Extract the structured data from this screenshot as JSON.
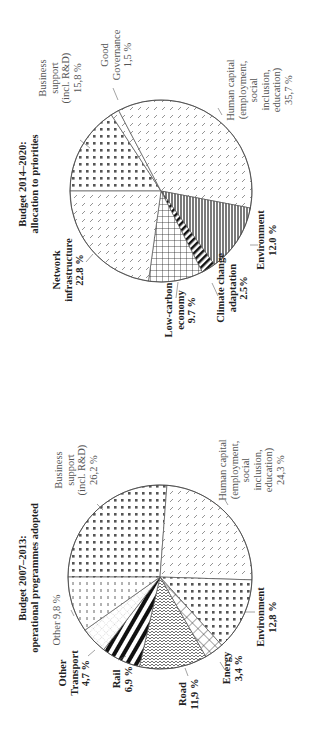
{
  "chart_data": [
    {
      "type": "pie",
      "title": "Budget 2014–2020: allocation to priorities",
      "title_lines": [
        "Budget 2014–2020:",
        "allocation to priorities"
      ],
      "start_angle_note": "slices clockwise from 12 o'clock (figure rotated 90° CCW)",
      "categories": [
        "Business support (incl. R&D)",
        "Good Governance",
        "Human capital (employment, social inclusion, education)",
        "Environment",
        "Climate change adaptation",
        "Low-carbon economy",
        "Network infrastructure"
      ],
      "values": [
        15.8,
        1.5,
        35.7,
        12.0,
        2.5,
        9.7,
        22.8
      ],
      "unit": "%",
      "value_labels": [
        "15,8 %",
        "1,5 %",
        "35,7 %",
        "12.0 %",
        "2.5%",
        "9.7 %",
        "22.8 %"
      ],
      "label_lines": [
        [
          "Business",
          "support",
          "(incl. R&D)",
          "15,8 %"
        ],
        [
          "Good",
          "Governance",
          "1,5 %"
        ],
        [
          "Human capital",
          "(employment,",
          "social",
          "inclusion,",
          "education)",
          "35,7 %"
        ],
        [
          "Environment",
          "12.0 %"
        ],
        [
          "Climate change",
          "adaptation",
          "2.5%"
        ],
        [
          "Low-carbon",
          "economy",
          "9.7 %"
        ],
        [
          "Network",
          "infrastructure",
          "22.8 %"
        ]
      ],
      "bold": [
        false,
        false,
        false,
        true,
        true,
        true,
        true
      ],
      "patterns": [
        "dots",
        "dashes",
        "dashes",
        "vlines",
        "stripes",
        "grid",
        "dashes"
      ]
    },
    {
      "type": "pie",
      "title": "Budget 2007–2013: operational programmes adopted",
      "title_lines": [
        "Budget 2007–2013:",
        "operational programmes adopted"
      ],
      "start_angle_note": "slices clockwise from 12 o'clock (figure rotated 90° CCW)",
      "categories": [
        "Business support (incl. R&D)",
        "Human capital (employment, social inclusion, education)",
        "Environment",
        "Energy",
        "Road",
        "Rail",
        "Other Transport",
        "Other"
      ],
      "values": [
        26.2,
        24.3,
        12.8,
        3.4,
        11.9,
        6.9,
        4.7,
        9.8
      ],
      "unit": "%",
      "value_labels": [
        "26,2 %",
        "24,3 %",
        "12,8 %",
        "3,4 %",
        "11,9 %",
        "6,9 %",
        "4,7 %",
        "9,8 %"
      ],
      "label_lines": [
        [
          "Business",
          "support",
          "(incl. R&D)",
          "26,2 %"
        ],
        [
          "Human capital",
          "(employment,",
          "social",
          "inclusion,",
          "education)",
          "24,3 %"
        ],
        [
          "Environment",
          "12,8 %"
        ],
        [
          "Energy",
          "3,4 %"
        ],
        [
          "Road",
          "11,9 %"
        ],
        [
          "Rail",
          "6,9 %"
        ],
        [
          "Other",
          "Transport",
          "4,7 %"
        ],
        [
          "Other  9,8 %"
        ]
      ],
      "bold": [
        false,
        false,
        true,
        true,
        true,
        true,
        true,
        false
      ],
      "patterns": [
        "dots",
        "dashes",
        "dots",
        "crosshatch",
        "waves",
        "hstripes",
        "dotgrid",
        "vdashes"
      ]
    }
  ]
}
